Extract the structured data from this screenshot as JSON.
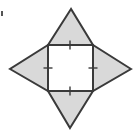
{
  "figure": {
    "name": "four-pointed-star-square-with-congruence-ticks",
    "type": "geometry-diagram",
    "canvas": {
      "width": 140,
      "height": 134,
      "background": "#ffffff"
    },
    "colors": {
      "triangle_fill": "#d9d9d9",
      "square_fill": "#ffffff",
      "stroke": "#3a3a3a",
      "tick_stroke": "#3a3a3a",
      "artifact": "#555555"
    },
    "stroke_width": 2,
    "square": {
      "label": "central-square",
      "fill": "#ffffff",
      "corners": {
        "top_left": [
          48,
          45
        ],
        "top_right": [
          93,
          45
        ],
        "bottom_right": [
          93,
          91
        ],
        "bottom_left": [
          48,
          91
        ]
      },
      "side_length_px": 45
    },
    "triangles": [
      {
        "label": "top-triangle",
        "apex": [
          71,
          9
        ],
        "base": [
          [
            48,
            45
          ],
          [
            93,
            45
          ]
        ],
        "fill": "#d9d9d9"
      },
      {
        "label": "right-triangle",
        "apex": [
          131,
          69
        ],
        "base": [
          [
            93,
            45
          ],
          [
            93,
            91
          ]
        ],
        "fill": "#d9d9d9"
      },
      {
        "label": "bottom-triangle",
        "apex": [
          70,
          128
        ],
        "base": [
          [
            93,
            91
          ],
          [
            48,
            91
          ]
        ],
        "fill": "#d9d9d9"
      },
      {
        "label": "left-triangle",
        "apex": [
          10,
          69
        ],
        "base": [
          [
            48,
            91
          ],
          [
            48,
            45
          ]
        ],
        "fill": "#d9d9d9"
      }
    ],
    "tick_marks": [
      {
        "label": "tick-top-side",
        "center": [
          70,
          45
        ],
        "orientation": "vertical",
        "length": 9
      },
      {
        "label": "tick-right-side",
        "center": [
          93,
          68
        ],
        "orientation": "horizontal",
        "length": 9
      },
      {
        "label": "tick-bottom-side",
        "center": [
          70,
          91
        ],
        "orientation": "vertical",
        "length": 9
      },
      {
        "label": "tick-left-side",
        "center": [
          48,
          68
        ],
        "orientation": "horizontal",
        "length": 9
      }
    ],
    "artifacts": [
      {
        "label": "edge-speck",
        "x": 1,
        "y": 11,
        "width": 2,
        "height": 5
      }
    ]
  }
}
